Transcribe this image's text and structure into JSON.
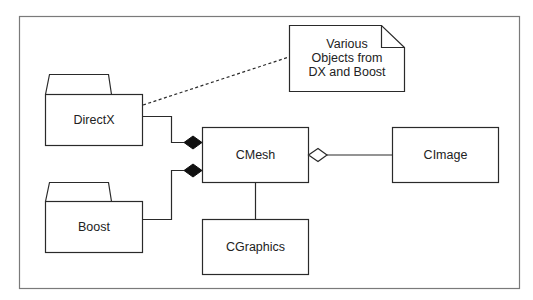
{
  "diagram": {
    "type": "UML class diagram",
    "packages": [
      {
        "id": "directx",
        "label": "DirectX"
      },
      {
        "id": "boost",
        "label": "Boost"
      }
    ],
    "classes": [
      {
        "id": "cmesh",
        "label": "CMesh"
      },
      {
        "id": "cimage",
        "label": "CImage"
      },
      {
        "id": "cgraphics",
        "label": "CGraphics"
      }
    ],
    "note": {
      "lines": [
        "Various",
        "Objects from",
        "DX and Boost"
      ]
    },
    "relationships": [
      {
        "from": "directx",
        "to": "cmesh",
        "kind": "composition"
      },
      {
        "from": "boost",
        "to": "cmesh",
        "kind": "composition"
      },
      {
        "from": "cimage",
        "to": "cmesh",
        "kind": "aggregation"
      },
      {
        "from": "cmesh",
        "to": "cgraphics",
        "kind": "association"
      },
      {
        "from": "note",
        "to": "directx",
        "kind": "note-anchor"
      }
    ],
    "colors": {
      "stroke": "#2a2a2a",
      "frame": "#7a7a7a",
      "fill": "#ffffff"
    }
  }
}
